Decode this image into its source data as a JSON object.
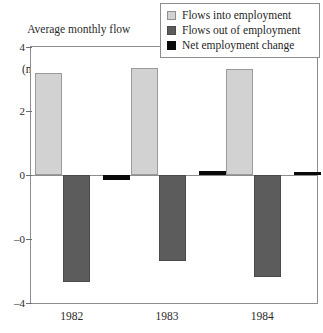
{
  "axis_caption": {
    "line1": "Average monthly flow",
    "line2": "(millions of workers)"
  },
  "legend": {
    "items": [
      {
        "label": "Flows into employment",
        "color": "#d2d2d2",
        "swatch_name": "legend-swatch-flows-in"
      },
      {
        "label": "Flows out of employment",
        "color": "#5c5c5c",
        "swatch_name": "legend-swatch-flows-out"
      },
      {
        "label": "Net employment change",
        "color": "#0a0a0a",
        "swatch_name": "legend-swatch-net-change"
      }
    ]
  },
  "chart_data": {
    "type": "bar",
    "title": "",
    "subtitle": "",
    "xlabel": "",
    "ylabel": "Average monthly flow (millions of workers)",
    "categories": [
      "1982",
      "1983",
      "1984"
    ],
    "series": [
      {
        "name": "Flows into employment",
        "color": "#d2d2d2",
        "values": [
          3.2,
          3.35,
          3.3
        ]
      },
      {
        "name": "Flows out of employment",
        "color": "#5c5c5c",
        "values": [
          -3.35,
          -2.7,
          -3.2
        ]
      },
      {
        "name": "Net employment change",
        "color": "#0a0a0a",
        "values": [
          -0.15,
          0.12,
          0.1
        ]
      }
    ],
    "ylim": [
      -4,
      4
    ],
    "yticks": [
      4,
      2,
      0,
      -2,
      -4
    ],
    "ytick_labels": [
      "4",
      "2",
      "0",
      "–0",
      "–4"
    ],
    "grid": false,
    "legend_position": "top-right",
    "axis_frame": true
  },
  "colors": {
    "flows_in": "#d2d2d2",
    "flows_out": "#5c5c5c",
    "net_change": "#0a0a0a",
    "frame": "#8d8d8d",
    "text": "#1f1f1f",
    "background": "#ffffff"
  }
}
